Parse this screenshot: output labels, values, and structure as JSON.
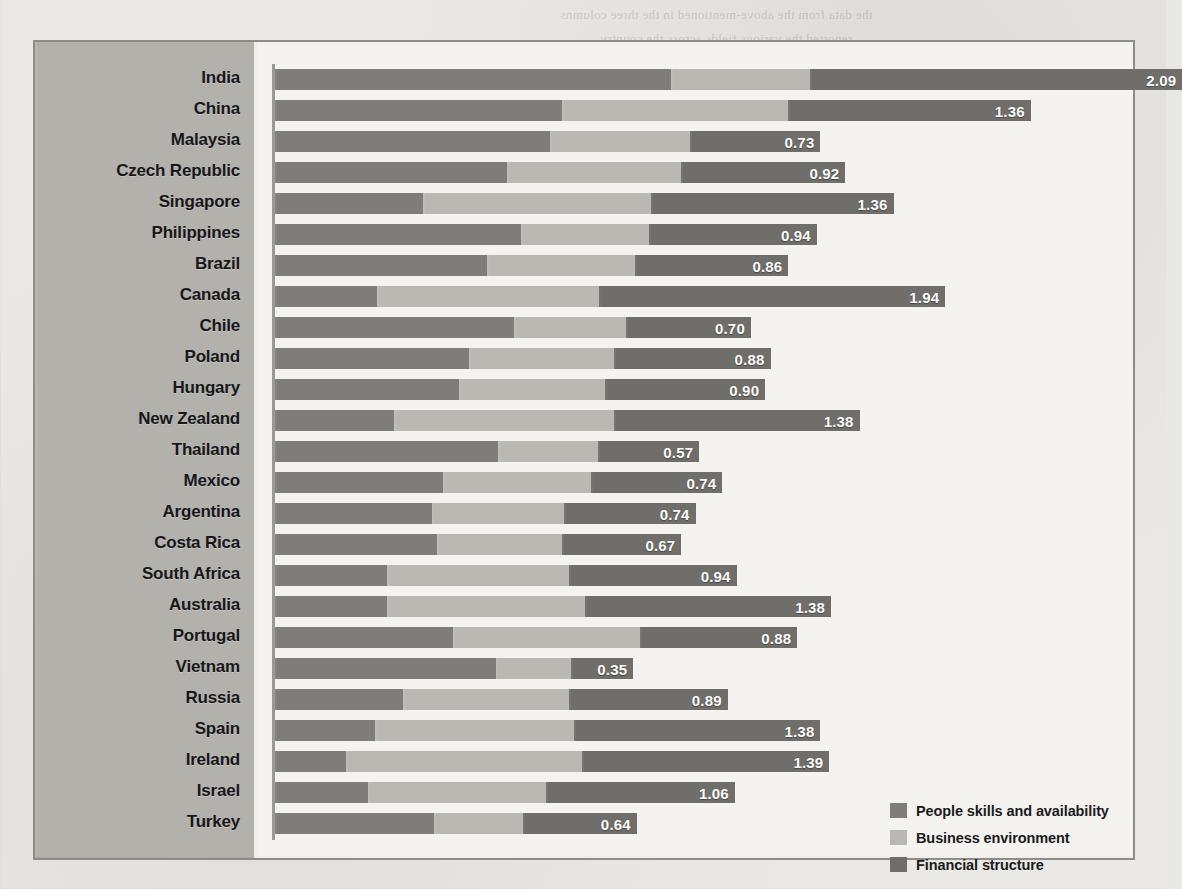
{
  "chart_data": {
    "type": "bar",
    "subtype": "horizontal-stacked",
    "title": "",
    "xlabel": "",
    "ylabel": "",
    "grid": false,
    "legend_position": "bottom-right",
    "xlim": [
      0,
      4.6
    ],
    "categories": [
      "India",
      "China",
      "Malaysia",
      "Czech Republic",
      "Singapore",
      "Philippines",
      "Brazil",
      "Canada",
      "Chile",
      "Poland",
      "Hungary",
      "New Zealand",
      "Thailand",
      "Mexico",
      "Argentina",
      "Costa Rica",
      "South Africa",
      "Australia",
      "Portugal",
      "Vietnam",
      "Russia",
      "Spain",
      "Ireland",
      "Israel",
      "Turkey"
    ],
    "series": [
      {
        "name": "People skills and availability",
        "color": "#7e7d79",
        "values": [
          2.22,
          1.61,
          1.54,
          1.3,
          0.83,
          1.38,
          1.19,
          0.57,
          1.34,
          1.09,
          1.03,
          0.67,
          1.25,
          0.94,
          0.88,
          0.91,
          0.63,
          0.63,
          1.0,
          1.24,
          0.72,
          0.56,
          0.4,
          0.52,
          0.89
        ]
      },
      {
        "name": "Business environment",
        "color": "#b9b8b3",
        "values": [
          0.78,
          1.27,
          0.79,
          0.98,
          1.28,
          0.72,
          0.83,
          1.25,
          0.63,
          0.81,
          0.82,
          1.23,
          0.56,
          0.83,
          0.74,
          0.7,
          1.02,
          1.11,
          1.05,
          0.42,
          0.93,
          1.12,
          1.32,
          1.0,
          0.5
        ]
      },
      {
        "name": "Financial structure",
        "color": "#6f6e6a",
        "values": [
          2.09,
          1.36,
          0.73,
          0.92,
          1.36,
          0.94,
          0.86,
          1.94,
          0.7,
          0.88,
          0.9,
          1.38,
          0.57,
          0.74,
          0.74,
          0.67,
          0.94,
          1.38,
          0.88,
          0.35,
          0.89,
          1.38,
          1.39,
          1.06,
          0.64
        ]
      }
    ],
    "value_labels": [
      "2.09",
      "1.36",
      "0.73",
      "0.92",
      "1.36",
      "0.94",
      "0.86",
      "1.94",
      "0.70",
      "0.88",
      "0.90",
      "1.38",
      "0.57",
      "0.74",
      "0.74",
      "0.67",
      "0.94",
      "1.38",
      "0.88",
      "0.35",
      "0.89",
      "1.38",
      "1.39",
      "1.06",
      "0.64"
    ]
  },
  "legend": {
    "items": [
      {
        "label": "People skills and availability",
        "color": "#7e7d79"
      },
      {
        "label": "Business environment",
        "color": "#b9b8b3"
      },
      {
        "label": "Financial structure",
        "color": "#6f6e6a"
      }
    ]
  },
  "background_text": [
    "the data from the above-mentioned in the three columns",
    "reported the various fields across the country"
  ]
}
